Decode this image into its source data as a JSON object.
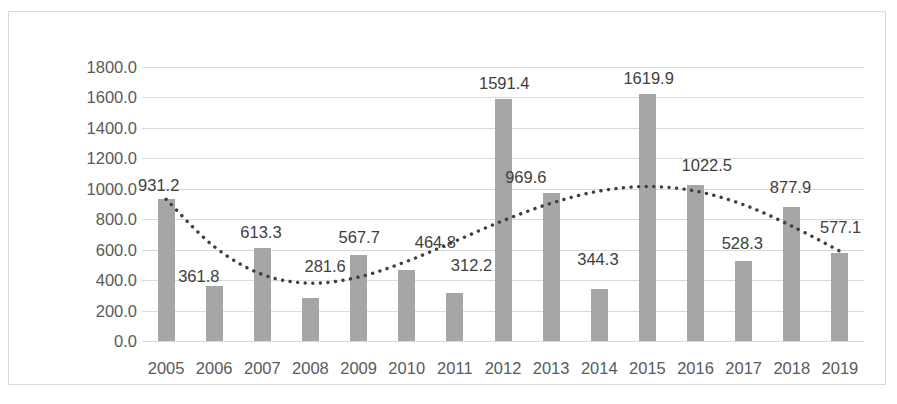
{
  "chart_data": {
    "type": "bar",
    "title": "",
    "xlabel": "",
    "ylabel": "",
    "grid": true,
    "legend": false,
    "ylim": [
      0,
      1800
    ],
    "ytick_step": 200,
    "ytick_labels": [
      "1800.0",
      "1600.0",
      "1400.0",
      "1200.0",
      "1000.0",
      "800.0",
      "600.0",
      "400.0",
      "200.0",
      "0.0"
    ],
    "ytick_values": [
      1800,
      1600,
      1400,
      1200,
      1000,
      800,
      600,
      400,
      200,
      0
    ],
    "categories": [
      "2005",
      "2006",
      "2007",
      "2008",
      "2009",
      "2010",
      "2011",
      "2012",
      "2013",
      "2014",
      "2015",
      "2016",
      "2017",
      "2018",
      "2019"
    ],
    "values": [
      931.2,
      361.8,
      613.3,
      281.6,
      567.7,
      464.8,
      312.2,
      1591.4,
      969.6,
      344.3,
      1619.9,
      1022.5,
      528.3,
      877.9,
      577.1
    ],
    "data_labels": [
      "931.2",
      "361.8",
      "613.3",
      "281.6",
      "567.7",
      "464.8",
      "312.2",
      "1591.4",
      "969.6",
      "344.3",
      "1619.9",
      "1022.5",
      "528.3",
      "877.9",
      "577.1"
    ],
    "series": [
      {
        "name": "bars",
        "style": "bar",
        "color": "#a6a6a6",
        "values": [
          931.2,
          361.8,
          613.3,
          281.6,
          567.7,
          464.8,
          312.2,
          1591.4,
          969.6,
          344.3,
          1619.9,
          1022.5,
          528.3,
          877.9,
          577.1
        ]
      },
      {
        "name": "trendline",
        "style": "dotted-line",
        "color": "#3f3f3f",
        "values": [
          931.2,
          620.0,
          437.0,
          380.0,
          420.0,
          523.0,
          655.0,
          790.0,
          905.0,
          985.0,
          1015.0,
          985.0,
          895.0,
          755.0,
          590.0
        ]
      }
    ]
  },
  "label_offsets": [
    {
      "year": "2005",
      "label": "931.2",
      "dx": -28,
      "dy": -22
    },
    {
      "year": "2006",
      "label": "361.8",
      "dx": -36,
      "dy": -18
    },
    {
      "year": "2007",
      "label": "613.3",
      "dx": -22,
      "dy": -24
    },
    {
      "year": "2008",
      "label": "281.6",
      "dx": -6,
      "dy": -40
    },
    {
      "year": "2009",
      "label": "567.7",
      "dx": -20,
      "dy": -26
    },
    {
      "year": "2010",
      "label": "464.8",
      "dx": 8,
      "dy": -36
    },
    {
      "year": "2011",
      "label": "312.2",
      "dx": -4,
      "dy": -36
    },
    {
      "year": "2012",
      "label": "1591.4",
      "dx": -24,
      "dy": -24
    },
    {
      "year": "2013",
      "label": "969.6",
      "dx": -46,
      "dy": -24
    },
    {
      "year": "2014",
      "label": "344.3",
      "dx": -22,
      "dy": -38
    },
    {
      "year": "2015",
      "label": "1619.9",
      "dx": -24,
      "dy": -24
    },
    {
      "year": "2016",
      "label": "1022.5",
      "dx": -14,
      "dy": -28
    },
    {
      "year": "2017",
      "label": "528.3",
      "dx": -22,
      "dy": -26
    },
    {
      "year": "2018",
      "label": "877.9",
      "dx": -22,
      "dy": -28
    },
    {
      "year": "2019",
      "label": "577.1",
      "dx": -20,
      "dy": -34
    }
  ]
}
